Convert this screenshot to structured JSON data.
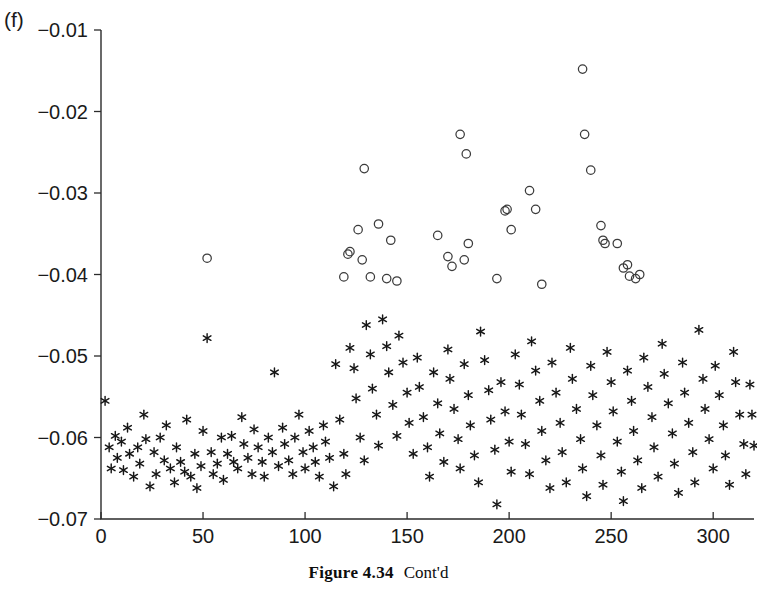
{
  "panel": {
    "label": "(f)"
  },
  "caption": {
    "bold": "Figure 4.34",
    "rest": "Cont'd"
  },
  "chart_data": {
    "type": "scatter",
    "title": "",
    "xlabel": "",
    "ylabel": "",
    "xlim": [
      0,
      320
    ],
    "ylim": [
      -0.07,
      -0.01
    ],
    "xticks": [
      0,
      50,
      100,
      150,
      200,
      250,
      300
    ],
    "xticklabels": [
      "0",
      "50",
      "100",
      "150",
      "200",
      "250",
      "300"
    ],
    "yticks": [
      -0.07,
      -0.06,
      -0.05,
      -0.04,
      -0.03,
      -0.02,
      -0.01
    ],
    "yticklabels": [
      "-0.07",
      "-0.06",
      "-0.05",
      "-0.04",
      "-0.03",
      "-0.02",
      "-0.01"
    ],
    "grid": false,
    "legend": null,
    "series": [
      {
        "name": "star-series",
        "marker": "star",
        "color": "#171717",
        "points": [
          [
            2,
            -0.0555
          ],
          [
            4,
            -0.0612
          ],
          [
            5,
            -0.0638
          ],
          [
            7,
            -0.0598
          ],
          [
            8,
            -0.0625
          ],
          [
            10,
            -0.0605
          ],
          [
            11,
            -0.064
          ],
          [
            13,
            -0.0588
          ],
          [
            14,
            -0.062
          ],
          [
            16,
            -0.0648
          ],
          [
            18,
            -0.0612
          ],
          [
            19,
            -0.0632
          ],
          [
            21,
            -0.0572
          ],
          [
            22,
            -0.0602
          ],
          [
            24,
            -0.066
          ],
          [
            26,
            -0.0618
          ],
          [
            27,
            -0.0645
          ],
          [
            29,
            -0.06
          ],
          [
            31,
            -0.0628
          ],
          [
            32,
            -0.0585
          ],
          [
            34,
            -0.0638
          ],
          [
            36,
            -0.0655
          ],
          [
            37,
            -0.0612
          ],
          [
            39,
            -0.063
          ],
          [
            41,
            -0.0642
          ],
          [
            42,
            -0.0578
          ],
          [
            44,
            -0.0648
          ],
          [
            46,
            -0.062
          ],
          [
            47,
            -0.0662
          ],
          [
            49,
            -0.0635
          ],
          [
            50,
            -0.0592
          ],
          [
            52,
            -0.0478
          ],
          [
            54,
            -0.0618
          ],
          [
            55,
            -0.0645
          ],
          [
            57,
            -0.0632
          ],
          [
            59,
            -0.06
          ],
          [
            60,
            -0.0652
          ],
          [
            62,
            -0.062
          ],
          [
            64,
            -0.0598
          ],
          [
            65,
            -0.063
          ],
          [
            67,
            -0.0638
          ],
          [
            69,
            -0.0575
          ],
          [
            70,
            -0.0608
          ],
          [
            72,
            -0.0625
          ],
          [
            74,
            -0.0645
          ],
          [
            75,
            -0.059
          ],
          [
            77,
            -0.0612
          ],
          [
            79,
            -0.063
          ],
          [
            80,
            -0.0648
          ],
          [
            82,
            -0.06
          ],
          [
            84,
            -0.0618
          ],
          [
            85,
            -0.052
          ],
          [
            87,
            -0.0635
          ],
          [
            89,
            -0.0588
          ],
          [
            90,
            -0.0608
          ],
          [
            92,
            -0.0628
          ],
          [
            94,
            -0.0645
          ],
          [
            95,
            -0.06
          ],
          [
            97,
            -0.0572
          ],
          [
            99,
            -0.0618
          ],
          [
            100,
            -0.0638
          ],
          [
            102,
            -0.0592
          ],
          [
            104,
            -0.0612
          ],
          [
            105,
            -0.063
          ],
          [
            107,
            -0.0648
          ],
          [
            109,
            -0.0585
          ],
          [
            110,
            -0.0605
          ],
          [
            112,
            -0.0625
          ],
          [
            114,
            -0.066
          ],
          [
            115,
            -0.051
          ],
          [
            117,
            -0.0578
          ],
          [
            119,
            -0.062
          ],
          [
            120,
            -0.0645
          ],
          [
            122,
            -0.049
          ],
          [
            124,
            -0.0515
          ],
          [
            125,
            -0.0552
          ],
          [
            127,
            -0.06
          ],
          [
            129,
            -0.0628
          ],
          [
            130,
            -0.0462
          ],
          [
            132,
            -0.0498
          ],
          [
            133,
            -0.054
          ],
          [
            135,
            -0.0572
          ],
          [
            136,
            -0.061
          ],
          [
            138,
            -0.0455
          ],
          [
            140,
            -0.0488
          ],
          [
            141,
            -0.052
          ],
          [
            143,
            -0.056
          ],
          [
            145,
            -0.0598
          ],
          [
            146,
            -0.0475
          ],
          [
            148,
            -0.0508
          ],
          [
            150,
            -0.0545
          ],
          [
            151,
            -0.0582
          ],
          [
            153,
            -0.062
          ],
          [
            155,
            -0.0502
          ],
          [
            156,
            -0.0538
          ],
          [
            158,
            -0.0575
          ],
          [
            160,
            -0.0612
          ],
          [
            161,
            -0.0648
          ],
          [
            163,
            -0.052
          ],
          [
            165,
            -0.0558
          ],
          [
            166,
            -0.0595
          ],
          [
            168,
            -0.063
          ],
          [
            170,
            -0.0492
          ],
          [
            171,
            -0.0528
          ],
          [
            173,
            -0.0565
          ],
          [
            175,
            -0.0602
          ],
          [
            176,
            -0.0638
          ],
          [
            178,
            -0.051
          ],
          [
            180,
            -0.0548
          ],
          [
            181,
            -0.0585
          ],
          [
            183,
            -0.0622
          ],
          [
            185,
            -0.0655
          ],
          [
            186,
            -0.047
          ],
          [
            188,
            -0.0505
          ],
          [
            190,
            -0.0542
          ],
          [
            191,
            -0.0578
          ],
          [
            193,
            -0.0615
          ],
          [
            194,
            -0.0682
          ],
          [
            196,
            -0.0532
          ],
          [
            198,
            -0.0568
          ],
          [
            200,
            -0.0605
          ],
          [
            201,
            -0.0642
          ],
          [
            203,
            -0.0498
          ],
          [
            205,
            -0.0535
          ],
          [
            206,
            -0.0572
          ],
          [
            208,
            -0.0608
          ],
          [
            210,
            -0.0645
          ],
          [
            211,
            -0.0482
          ],
          [
            213,
            -0.0518
          ],
          [
            215,
            -0.0555
          ],
          [
            216,
            -0.0592
          ],
          [
            218,
            -0.0628
          ],
          [
            220,
            -0.0662
          ],
          [
            221,
            -0.0508
          ],
          [
            223,
            -0.0545
          ],
          [
            225,
            -0.0582
          ],
          [
            226,
            -0.0618
          ],
          [
            228,
            -0.0655
          ],
          [
            230,
            -0.049
          ],
          [
            231,
            -0.0528
          ],
          [
            233,
            -0.0565
          ],
          [
            235,
            -0.0602
          ],
          [
            236,
            -0.0638
          ],
          [
            238,
            -0.0672
          ],
          [
            240,
            -0.0512
          ],
          [
            241,
            -0.0548
          ],
          [
            243,
            -0.0585
          ],
          [
            245,
            -0.0622
          ],
          [
            246,
            -0.0658
          ],
          [
            248,
            -0.0495
          ],
          [
            250,
            -0.0532
          ],
          [
            251,
            -0.0568
          ],
          [
            253,
            -0.0605
          ],
          [
            255,
            -0.0642
          ],
          [
            256,
            -0.0678
          ],
          [
            258,
            -0.0518
          ],
          [
            260,
            -0.0555
          ],
          [
            261,
            -0.0592
          ],
          [
            263,
            -0.0628
          ],
          [
            265,
            -0.0662
          ],
          [
            266,
            -0.0502
          ],
          [
            268,
            -0.0538
          ],
          [
            270,
            -0.0575
          ],
          [
            271,
            -0.0612
          ],
          [
            273,
            -0.0648
          ],
          [
            275,
            -0.0485
          ],
          [
            276,
            -0.0522
          ],
          [
            278,
            -0.0558
          ],
          [
            280,
            -0.0595
          ],
          [
            281,
            -0.0632
          ],
          [
            283,
            -0.0668
          ],
          [
            285,
            -0.0508
          ],
          [
            286,
            -0.0545
          ],
          [
            288,
            -0.0582
          ],
          [
            290,
            -0.0618
          ],
          [
            291,
            -0.0655
          ],
          [
            293,
            -0.0468
          ],
          [
            295,
            -0.0528
          ],
          [
            296,
            -0.0565
          ],
          [
            298,
            -0.0602
          ],
          [
            300,
            -0.0638
          ],
          [
            301,
            -0.0512
          ],
          [
            303,
            -0.0548
          ],
          [
            305,
            -0.0585
          ],
          [
            306,
            -0.0622
          ],
          [
            308,
            -0.0658
          ],
          [
            310,
            -0.0495
          ],
          [
            311,
            -0.0532
          ],
          [
            313,
            -0.0572
          ],
          [
            315,
            -0.0608
          ],
          [
            316,
            -0.0645
          ],
          [
            318,
            -0.0535
          ],
          [
            319,
            -0.0572
          ],
          [
            320,
            -0.061
          ]
        ]
      },
      {
        "name": "circle-series",
        "marker": "circle",
        "color": "#3b3b3b",
        "points": [
          [
            52,
            -0.038
          ],
          [
            119,
            -0.0403
          ],
          [
            121,
            -0.0375
          ],
          [
            122,
            -0.0372
          ],
          [
            126,
            -0.0345
          ],
          [
            128,
            -0.0382
          ],
          [
            129,
            -0.027
          ],
          [
            132,
            -0.0403
          ],
          [
            136,
            -0.0338
          ],
          [
            140,
            -0.0405
          ],
          [
            142,
            -0.0358
          ],
          [
            145,
            -0.0408
          ],
          [
            165,
            -0.0352
          ],
          [
            170,
            -0.0378
          ],
          [
            172,
            -0.039
          ],
          [
            176,
            -0.0228
          ],
          [
            178,
            -0.0382
          ],
          [
            179,
            -0.0252
          ],
          [
            180,
            -0.0362
          ],
          [
            194,
            -0.0405
          ],
          [
            198,
            -0.0322
          ],
          [
            199,
            -0.032
          ],
          [
            201,
            -0.0345
          ],
          [
            210,
            -0.0297
          ],
          [
            213,
            -0.032
          ],
          [
            216,
            -0.0412
          ],
          [
            236,
            -0.0148
          ],
          [
            237,
            -0.0228
          ],
          [
            240,
            -0.0272
          ],
          [
            245,
            -0.034
          ],
          [
            246,
            -0.0358
          ],
          [
            247,
            -0.0362
          ],
          [
            253,
            -0.0362
          ],
          [
            256,
            -0.0392
          ],
          [
            258,
            -0.0388
          ],
          [
            259,
            -0.0402
          ],
          [
            262,
            -0.0405
          ],
          [
            264,
            -0.04
          ]
        ]
      }
    ]
  },
  "axis_geometry": {
    "left_px": 101,
    "right_px": 754,
    "top_px": 30,
    "bottom_px": 519
  }
}
